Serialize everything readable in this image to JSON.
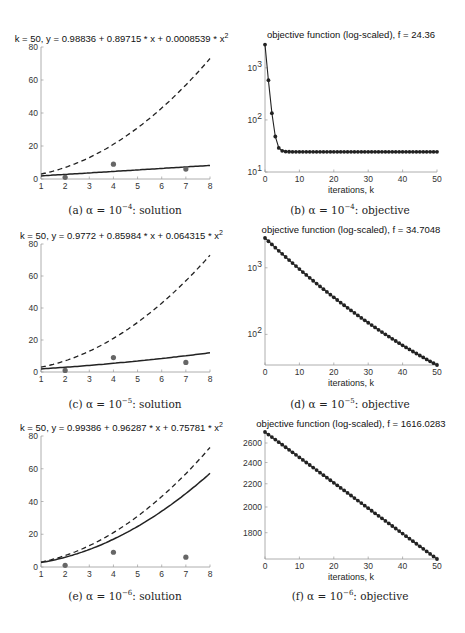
{
  "figure": {
    "captions": [
      {
        "label": "(a)",
        "alpha_text": "α = 10",
        "exp": "−4",
        "suffix": ": solution"
      },
      {
        "label": "(b)",
        "alpha_text": "α = 10",
        "exp": "−4",
        "suffix": ": objective"
      },
      {
        "label": "(c)",
        "alpha_text": "α = 10",
        "exp": "−5",
        "suffix": ": solution"
      },
      {
        "label": "(d)",
        "alpha_text": "α = 10",
        "exp": "−5",
        "suffix": ": objective"
      },
      {
        "label": "(e)",
        "alpha_text": "α = 10",
        "exp": "−6",
        "suffix": ": solution"
      },
      {
        "label": "(f)",
        "alpha_text": "α = 10",
        "exp": "−6",
        "suffix": ": objective"
      }
    ]
  },
  "chart_data": [
    {
      "id": "a",
      "type": "line",
      "title": "k = 50, y = 0.98836 + 0.89715 * x + 0.0008539 * x^2",
      "xlabel": "",
      "ylabel": "",
      "xlim": [
        1,
        8
      ],
      "ylim": [
        0,
        80
      ],
      "xticks": [
        1,
        2,
        3,
        4,
        5,
        6,
        7,
        8
      ],
      "yticks": [
        0,
        20,
        40,
        60,
        80
      ],
      "grid": false,
      "series": [
        {
          "name": "fitted solution",
          "style": "solid",
          "coeffs": [
            0.98836,
            0.89715,
            0.0008539
          ]
        },
        {
          "name": "reference curve",
          "style": "dashed",
          "coeffs": [
            1,
            1,
            1
          ]
        },
        {
          "name": "data points",
          "style": "markers",
          "x": [
            2,
            4,
            7
          ],
          "y": [
            1,
            9,
            6
          ]
        }
      ]
    },
    {
      "id": "b",
      "type": "line",
      "title": "objective function (log-scaled), f = 24.36",
      "xlabel": "iterations, k",
      "ylabel": "",
      "yscale": "log",
      "xlim": [
        0,
        50
      ],
      "ylim": [
        10,
        3000
      ],
      "xticks": [
        0,
        10,
        20,
        30,
        40,
        50
      ],
      "yticks": [
        {
          "v": 10,
          "base": "10",
          "exp": "1"
        },
        {
          "v": 100,
          "base": "10",
          "exp": "2"
        },
        {
          "v": 1000,
          "base": "10",
          "exp": "3"
        }
      ],
      "grid": false,
      "series": [
        {
          "name": "objective",
          "x_start": 0,
          "x_step": 1,
          "y": [
            2800,
            580,
            135,
            48,
            29,
            25.5,
            24.7,
            24.5,
            24.45,
            24.42,
            24.4,
            24.39,
            24.38,
            24.38,
            24.37,
            24.37,
            24.37,
            24.37,
            24.36,
            24.36,
            24.36,
            24.36,
            24.36,
            24.36,
            24.36,
            24.36,
            24.36,
            24.36,
            24.36,
            24.36,
            24.36,
            24.36,
            24.36,
            24.36,
            24.36,
            24.36,
            24.36,
            24.36,
            24.36,
            24.36,
            24.36,
            24.36,
            24.36,
            24.36,
            24.36,
            24.36,
            24.36,
            24.36,
            24.36,
            24.36,
            24.36
          ]
        }
      ]
    },
    {
      "id": "c",
      "type": "line",
      "title": "k = 50, y = 0.9772 + 0.85984 * x + 0.064315 * x^2",
      "xlabel": "",
      "ylabel": "",
      "xlim": [
        1,
        8
      ],
      "ylim": [
        0,
        80
      ],
      "xticks": [
        1,
        2,
        3,
        4,
        5,
        6,
        7,
        8
      ],
      "yticks": [
        0,
        20,
        40,
        60,
        80
      ],
      "grid": false,
      "series": [
        {
          "name": "fitted solution",
          "style": "solid",
          "coeffs": [
            0.9772,
            0.85984,
            0.064315
          ]
        },
        {
          "name": "reference curve",
          "style": "dashed",
          "coeffs": [
            1,
            1,
            1
          ]
        },
        {
          "name": "data points",
          "style": "markers",
          "x": [
            2,
            4,
            7
          ],
          "y": [
            1,
            9,
            6
          ]
        }
      ]
    },
    {
      "id": "d",
      "type": "line",
      "title": "objective function (log-scaled), f = 34.7048",
      "xlabel": "iterations, k",
      "ylabel": "",
      "yscale": "log",
      "xlim": [
        0,
        50
      ],
      "ylim": [
        34.7,
        2800
      ],
      "xticks": [
        0,
        10,
        20,
        30,
        40,
        50
      ],
      "yticks": [
        {
          "v": 100,
          "base": "10",
          "exp": "2"
        },
        {
          "v": 1000,
          "base": "10",
          "exp": "3"
        }
      ],
      "grid": false,
      "series": [
        {
          "name": "objective",
          "x_start": 0,
          "x_step": 1,
          "start": 2800,
          "end": 34.7048,
          "shape": "convex-log"
        }
      ]
    },
    {
      "id": "e",
      "type": "line",
      "title": "k = 50, y = 0.99386 + 0.96287 * x + 0.75781 * x^2",
      "xlabel": "",
      "ylabel": "",
      "xlim": [
        1,
        8
      ],
      "ylim": [
        0,
        80
      ],
      "xticks": [
        1,
        2,
        3,
        4,
        5,
        6,
        7,
        8
      ],
      "yticks": [
        0,
        20,
        40,
        60,
        80
      ],
      "grid": false,
      "series": [
        {
          "name": "fitted solution",
          "style": "solid",
          "coeffs": [
            0.99386,
            0.96287,
            0.75781
          ]
        },
        {
          "name": "reference curve",
          "style": "dashed",
          "coeffs": [
            1,
            1,
            1
          ]
        },
        {
          "name": "data points",
          "style": "markers",
          "x": [
            2,
            4,
            7
          ],
          "y": [
            1,
            9,
            6
          ]
        }
      ]
    },
    {
      "id": "f",
      "type": "line",
      "title": "objective function (log-scaled), f = 1616.0283",
      "xlabel": "iterations, k",
      "ylabel": "",
      "yscale": "log",
      "xlim": [
        0,
        50
      ],
      "ylim": [
        1616.0283,
        2720
      ],
      "xticks": [
        0,
        10,
        20,
        30,
        40,
        50
      ],
      "yticks": [
        {
          "v": 1800,
          "base": "1800",
          "exp": ""
        },
        {
          "v": 2000,
          "base": "2000",
          "exp": ""
        },
        {
          "v": 2200,
          "base": "2200",
          "exp": ""
        },
        {
          "v": 2400,
          "base": "2400",
          "exp": ""
        },
        {
          "v": 2600,
          "base": "2600",
          "exp": ""
        }
      ],
      "grid": false,
      "series": [
        {
          "name": "objective",
          "x_start": 0,
          "x_step": 1,
          "start": 2720,
          "end": 1616.0283,
          "shape": "linear"
        }
      ]
    }
  ]
}
